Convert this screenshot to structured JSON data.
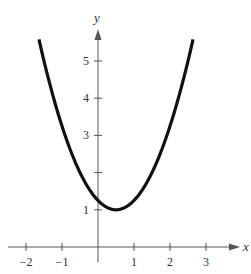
{
  "chart_data": {
    "type": "line",
    "title": "",
    "xlabel": "x",
    "ylabel": "y",
    "function": "y = x^2 - x + 1.25",
    "xlim": [
      -2.5,
      3.8
    ],
    "ylim": [
      -0.3,
      5.9
    ],
    "x_ticks": [
      -2,
      -1,
      1,
      2,
      3
    ],
    "x_tick_labels": [
      "−2",
      "−1",
      "1",
      "2",
      "3"
    ],
    "y_ticks": [
      1,
      2,
      3,
      4,
      5
    ],
    "y_tick_labels": [
      "1",
      "",
      "3",
      "4",
      "5"
    ],
    "grid": false,
    "legend": null,
    "series": [
      {
        "name": "parabola",
        "x": [
          -1.64,
          -1.5,
          -1,
          -0.5,
          0,
          0.25,
          0.5,
          0.75,
          1,
          1.5,
          2,
          2.5,
          2.64
        ],
        "y": [
          5.54,
          5.25,
          3.25,
          2.25,
          1.25,
          1.06,
          1.0,
          1.06,
          1.25,
          2.25,
          3.25,
          5.25,
          5.54
        ]
      }
    ],
    "vertex": [
      0.5,
      1.0
    ]
  },
  "labels": {
    "x_axis": "x",
    "y_axis": "y"
  }
}
